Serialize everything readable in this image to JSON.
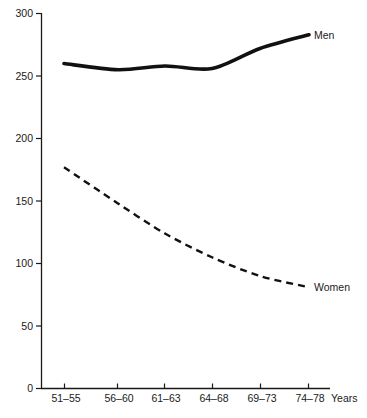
{
  "chart_data": {
    "type": "line",
    "title": "",
    "subtitle": "",
    "xlabel": "Years",
    "ylabel": "",
    "grid": false,
    "legend_position": "inline-right-of-line-end",
    "xlim_categories": [
      "51-55",
      "56-60",
      "61-63",
      "64-68",
      "69-73",
      "74-78"
    ],
    "categories": [
      "51–55",
      "56–60",
      "61–63",
      "64–68",
      "69–73",
      "74–78"
    ],
    "x_axis_suffix_label": "Years",
    "ylim": [
      0,
      300
    ],
    "yticks": [
      0,
      50,
      100,
      150,
      200,
      250,
      300
    ],
    "ytick_labels": [
      "0",
      "50",
      "100",
      "150",
      "200",
      "250",
      "300"
    ],
    "series": [
      {
        "name": "Men",
        "label": "Men",
        "style": "solid-thick",
        "color": "#111111",
        "values": [
          260,
          255,
          258,
          256,
          272,
          283
        ]
      },
      {
        "name": "Women",
        "label": "Women",
        "style": "dashed",
        "color": "#111111",
        "values": [
          177,
          148,
          124,
          105,
          90,
          81
        ]
      }
    ],
    "annotations": [
      {
        "text": "Men",
        "series": "Men",
        "anchor": "end-of-line"
      },
      {
        "text": "Women",
        "series": "Women",
        "anchor": "end-of-line"
      }
    ]
  },
  "axis": {
    "y_ticks": [
      {
        "label": "300",
        "value": 300
      },
      {
        "label": "250",
        "value": 250
      },
      {
        "label": "200",
        "value": 200
      },
      {
        "label": "150",
        "value": 150
      },
      {
        "label": "100",
        "value": 100
      },
      {
        "label": "50",
        "value": 50
      },
      {
        "label": "0",
        "value": 0
      }
    ],
    "x_ticks": [
      {
        "label": "51–55"
      },
      {
        "label": "56–60"
      },
      {
        "label": "61–63"
      },
      {
        "label": "64–68"
      },
      {
        "label": "69–73"
      },
      {
        "label": "74–78"
      }
    ],
    "x_unit_label": "Years"
  },
  "legend": {
    "men": "Men",
    "women": "Women"
  },
  "colors": {
    "ink": "#111111",
    "background": "#ffffff"
  }
}
